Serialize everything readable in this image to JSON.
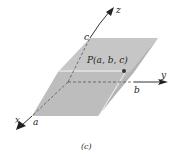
{
  "figure": {
    "caption": "(c)",
    "point_label": "P(a, b, c)",
    "axes": {
      "x": "x",
      "y": "y",
      "z": "z"
    },
    "intercepts": {
      "a": "a",
      "b": "b",
      "c": "c"
    },
    "colors": {
      "plane_fill": "#bdbdbd",
      "plane_top": "#c4c4c4",
      "plane_side": "#b0b0b0",
      "axis": "#333333",
      "highlight": "#f2f2f2",
      "point": "#333333"
    }
  }
}
